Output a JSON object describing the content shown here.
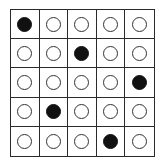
{
  "grid": {
    "rows": 5,
    "cols": 5,
    "filled": [
      [
        0,
        0
      ],
      [
        1,
        2
      ],
      [
        2,
        4
      ],
      [
        3,
        1
      ],
      [
        4,
        3
      ]
    ],
    "cells": [
      [
        1,
        0,
        0,
        0,
        0
      ],
      [
        0,
        0,
        1,
        0,
        0
      ],
      [
        0,
        0,
        0,
        0,
        1
      ],
      [
        0,
        1,
        0,
        0,
        0
      ],
      [
        0,
        0,
        0,
        1,
        0
      ]
    ]
  },
  "colors": {
    "filled": "#111111",
    "empty": "#ffffff",
    "line": "#2a2a2a"
  }
}
